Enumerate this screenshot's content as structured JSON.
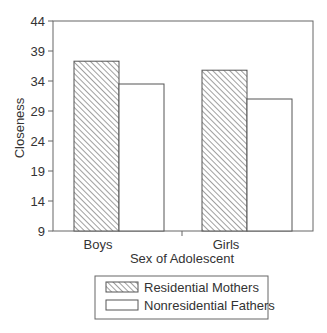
{
  "chart_data": {
    "type": "bar",
    "title": "",
    "xlabel": "Sex of Adolescent",
    "ylabel": "Closeness",
    "categories": [
      "Boys",
      "Girls"
    ],
    "series": [
      {
        "name": "Residential Mothers",
        "values": [
          37.3,
          35.8
        ],
        "pattern": "hatched"
      },
      {
        "name": "Nonresidential Fathers",
        "values": [
          33.5,
          31.0
        ],
        "pattern": "solid-white"
      }
    ],
    "ylim": [
      9,
      44
    ],
    "yticks": [
      9,
      14,
      19,
      24,
      29,
      34,
      39,
      44
    ],
    "grid": false,
    "legend_position": "bottom"
  },
  "axes": {
    "ylabel": "Closeness",
    "xlabel": "Sex of Adolescent",
    "ytick_labels": [
      "9",
      "14",
      "19",
      "24",
      "29",
      "34",
      "39",
      "44"
    ],
    "xtick_labels": [
      "Boys",
      "Girls"
    ]
  },
  "legend": {
    "items": [
      {
        "label": "Residential Mothers"
      },
      {
        "label": "Nonresidential Fathers"
      }
    ]
  },
  "colors": {
    "stroke": "#555555",
    "hatch": "#777777",
    "background": "#ffffff"
  }
}
